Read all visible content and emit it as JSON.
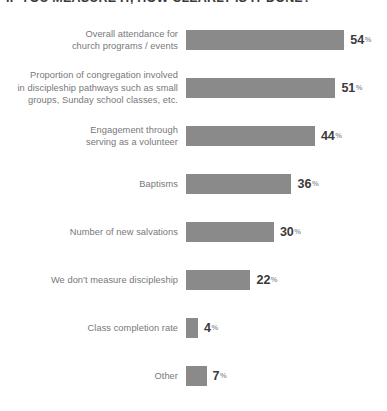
{
  "chart_data": {
    "type": "bar",
    "orientation": "horizontal",
    "title": "IF YOU MEASURE IT, HOW CLEARLY IS IT DONE?",
    "title_clipped": true,
    "subtitle": "",
    "xlabel": "",
    "ylabel": "",
    "xlim": [
      0,
      60
    ],
    "grid": false,
    "legend": null,
    "value_suffix": "%",
    "categories": [
      "Overall attendance for\nchurch programs / events",
      "Proportion of congregation involved\nin discipleship pathways such as small\ngroups, Sunday school classes, etc.",
      "Engagement through\nserving as a volunteer",
      "Baptisms",
      "Number of new salvations",
      "We don't measure discipleship",
      "Class completion rate",
      "Other"
    ],
    "values": [
      54,
      51,
      44,
      36,
      30,
      22,
      4,
      7
    ],
    "bars": [
      {
        "label": "Overall attendance for\nchurch programs / events",
        "value": 54,
        "value_text": "54",
        "pct_symbol": "%"
      },
      {
        "label": "Proportion of congregation involved\nin discipleship pathways such as small\ngroups, Sunday school classes, etc.",
        "value": 51,
        "value_text": "51",
        "pct_symbol": "%"
      },
      {
        "label": "Engagement through\nserving as a volunteer",
        "value": 44,
        "value_text": "44",
        "pct_symbol": "%"
      },
      {
        "label": "Baptisms",
        "value": 36,
        "value_text": "36",
        "pct_symbol": "%"
      },
      {
        "label": "Number of new salvations",
        "value": 30,
        "value_text": "30",
        "pct_symbol": "%"
      },
      {
        "label": "We don't measure discipleship",
        "value": 22,
        "value_text": "22",
        "pct_symbol": "%"
      },
      {
        "label": "Class completion rate",
        "value": 4,
        "value_text": "4",
        "pct_symbol": "%"
      },
      {
        "label": "Other",
        "value": 7,
        "value_text": "7",
        "pct_symbol": "%"
      }
    ],
    "colors": {
      "bar_fill": "#8a8a8a",
      "label_text": "#77787b",
      "value_text": "#3a3a3c",
      "percent_symbol": "#9a9a9d",
      "background": "#ffffff",
      "title_text": "#3a3a3c"
    },
    "scale": {
      "px_per_percent": 2.93,
      "min_bar_px": 12
    }
  }
}
